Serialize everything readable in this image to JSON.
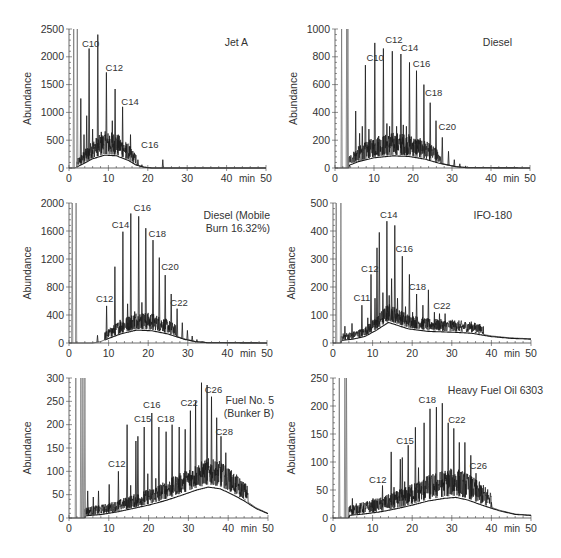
{
  "figure": {
    "panel_count": 6
  },
  "style": {
    "trace_color": "#1a1a1a",
    "trace_light_color": "#777777",
    "axis_color": "#444444",
    "text_color": "#333333",
    "background": "#ffffff"
  },
  "chart_data": [
    {
      "type": "line",
      "title": "Jet A",
      "xlabel": "min",
      "ylabel": "Abundance",
      "xlim": [
        0,
        50
      ],
      "ylim": [
        0,
        2500
      ],
      "xticks": [
        0,
        10,
        20,
        30,
        40,
        50
      ],
      "yticks": [
        0,
        500,
        1000,
        1500,
        2000,
        2500
      ],
      "grid": false,
      "layout": {
        "x0": 69,
        "x1": 266,
        "ytop": 29,
        "ybot": 168,
        "title_x": 248,
        "title_y": 46,
        "title_anchor": "end"
      },
      "hump": [
        [
          1.5,
          0
        ],
        [
          3,
          60
        ],
        [
          6,
          180
        ],
        [
          9,
          250
        ],
        [
          12,
          240
        ],
        [
          15,
          150
        ],
        [
          17,
          60
        ],
        [
          19,
          15
        ],
        [
          21,
          0
        ],
        [
          50,
          0
        ]
      ],
      "noise_range": [
        2,
        17
      ],
      "noise_amp": 330,
      "peaks": [
        [
          1.2,
          2500
        ],
        [
          2.1,
          2500
        ],
        [
          3,
          1250
        ],
        [
          3.8,
          600
        ],
        [
          4.5,
          940
        ],
        [
          5.1,
          2150
        ],
        [
          6,
          700
        ],
        [
          7.3,
          2400
        ],
        [
          8.2,
          650
        ],
        [
          9.5,
          1720
        ],
        [
          10.3,
          580
        ],
        [
          11,
          850
        ],
        [
          11.7,
          1420
        ],
        [
          12.4,
          500
        ],
        [
          13.6,
          1100
        ],
        [
          14.5,
          400
        ],
        [
          15.6,
          600
        ],
        [
          17.5,
          150
        ],
        [
          18.5,
          60
        ],
        [
          23.8,
          150
        ]
      ],
      "labels": [
        {
          "text": "C10",
          "x": 5.5,
          "y": 2180
        },
        {
          "text": "C12",
          "x": 11.5,
          "y": 1740
        },
        {
          "text": "C14",
          "x": 15.5,
          "y": 1140
        },
        {
          "text": "C16",
          "x": 20.5,
          "y": 360
        }
      ]
    },
    {
      "type": "line",
      "title": "Diesel",
      "xlabel": "min",
      "ylabel": "Abundance",
      "xlim": [
        0,
        50
      ],
      "ylim": [
        0,
        1000
      ],
      "xticks": [
        0,
        10,
        20,
        30,
        40,
        50
      ],
      "yticks": [
        0,
        200,
        400,
        600,
        800,
        1000
      ],
      "grid": false,
      "layout": {
        "x0": 335,
        "x1": 530,
        "ytop": 29,
        "ybot": 168,
        "title_x": 512,
        "title_y": 46,
        "title_anchor": "end"
      },
      "hump": [
        [
          3.5,
          20
        ],
        [
          6,
          50
        ],
        [
          10,
          80
        ],
        [
          15,
          95
        ],
        [
          19,
          90
        ],
        [
          23,
          70
        ],
        [
          27,
          35
        ],
        [
          31,
          10
        ],
        [
          34,
          2
        ],
        [
          50,
          0
        ]
      ],
      "noise_range": [
        3.5,
        27
      ],
      "noise_amp": 130,
      "peaks": [
        [
          1.7,
          1000
        ],
        [
          3,
          1000
        ],
        [
          3.3,
          1000
        ],
        [
          5.3,
          410
        ],
        [
          6.3,
          250
        ],
        [
          7,
          300
        ],
        [
          7.8,
          740
        ],
        [
          8.7,
          280
        ],
        [
          9.8,
          200
        ],
        [
          10.2,
          900
        ],
        [
          11.2,
          230
        ],
        [
          12.4,
          860
        ],
        [
          13.3,
          320
        ],
        [
          14,
          300
        ],
        [
          14.7,
          840
        ],
        [
          15.8,
          300
        ],
        [
          16.9,
          820
        ],
        [
          17.5,
          310
        ],
        [
          18.3,
          300
        ],
        [
          19.1,
          760
        ],
        [
          20.1,
          190
        ],
        [
          20.9,
          700
        ],
        [
          21.9,
          200
        ],
        [
          22.8,
          600
        ],
        [
          24.4,
          470
        ],
        [
          25.9,
          340
        ],
        [
          27.5,
          220
        ],
        [
          29.1,
          120
        ],
        [
          30.6,
          60
        ],
        [
          32,
          30
        ],
        [
          33.5,
          15
        ]
      ],
      "labels": [
        {
          "text": "C10",
          "x": 10.3,
          "y": 770
        },
        {
          "text": "C12",
          "x": 15.1,
          "y": 900
        },
        {
          "text": "C14",
          "x": 19.1,
          "y": 845
        },
        {
          "text": "C16",
          "x": 22.2,
          "y": 725
        },
        {
          "text": "C18",
          "x": 25.3,
          "y": 520
        },
        {
          "text": "C20",
          "x": 28.8,
          "y": 275
        }
      ]
    },
    {
      "type": "line",
      "title": "Diesel (Mobile Burn 16.32%)",
      "title_lines": [
        "Diesel (Mobile",
        "Burn 16.32%)"
      ],
      "xlabel": "min",
      "ylabel": "Abundance",
      "xlim": [
        0,
        50
      ],
      "ylim": [
        0,
        2000
      ],
      "xticks": [
        0,
        10,
        20,
        30,
        40,
        50
      ],
      "yticks": [
        0,
        400,
        800,
        1200,
        1600,
        2000
      ],
      "grid": false,
      "layout": {
        "x0": 69,
        "x1": 267,
        "ytop": 203,
        "ybot": 343,
        "title_x": 270,
        "title_y": 219,
        "title_anchor": "end"
      },
      "hump": [
        [
          6,
          0
        ],
        [
          8,
          20
        ],
        [
          10,
          70
        ],
        [
          13,
          140
        ],
        [
          17,
          200
        ],
        [
          21,
          190
        ],
        [
          25,
          140
        ],
        [
          29,
          60
        ],
        [
          32,
          20
        ],
        [
          35,
          5
        ],
        [
          50,
          0
        ]
      ],
      "noise_range": [
        9,
        27
      ],
      "noise_amp": 200,
      "peaks": [
        [
          0.8,
          2000
        ],
        [
          1.8,
          2000
        ],
        [
          7.2,
          110
        ],
        [
          9.5,
          530
        ],
        [
          10.8,
          210
        ],
        [
          11.6,
          1090
        ],
        [
          12.9,
          330
        ],
        [
          13.6,
          1590
        ],
        [
          14.8,
          560
        ],
        [
          15.6,
          1850
        ],
        [
          16.6,
          450
        ],
        [
          17.6,
          1810
        ],
        [
          18.4,
          580
        ],
        [
          19.4,
          1640
        ],
        [
          20.4,
          320
        ],
        [
          21.2,
          1470
        ],
        [
          22.8,
          1220
        ],
        [
          24.3,
          970
        ],
        [
          25.8,
          700
        ],
        [
          27.3,
          490
        ],
        [
          28.6,
          290
        ],
        [
          29.9,
          180
        ],
        [
          31.1,
          100
        ],
        [
          32.3,
          50
        ],
        [
          33.6,
          25
        ]
      ],
      "labels": [
        {
          "text": "C12",
          "x": 9.0,
          "y": 590
        },
        {
          "text": "C14",
          "x": 13.0,
          "y": 1650
        },
        {
          "text": "C16",
          "x": 18.5,
          "y": 1880
        },
        {
          "text": "C18",
          "x": 22.3,
          "y": 1520
        },
        {
          "text": "C20",
          "x": 25.5,
          "y": 1040
        },
        {
          "text": "C22",
          "x": 27.8,
          "y": 530
        }
      ]
    },
    {
      "type": "line",
      "title": "IFO-180",
      "xlabel": "min",
      "ylabel": "Abundance",
      "xlim": [
        0,
        50
      ],
      "ylim": [
        0,
        500
      ],
      "xticks": [
        0,
        10,
        20,
        30,
        40,
        50
      ],
      "yticks": [
        0,
        100,
        200,
        300,
        400,
        500
      ],
      "grid": false,
      "layout": {
        "x0": 333,
        "x1": 531,
        "ytop": 203,
        "ybot": 343,
        "title_x": 512,
        "title_y": 219,
        "title_anchor": "end"
      },
      "hump": [
        [
          2,
          10
        ],
        [
          5,
          15
        ],
        [
          8,
          25
        ],
        [
          11,
          50
        ],
        [
          14,
          80
        ],
        [
          16,
          70
        ],
        [
          19,
          55
        ],
        [
          24,
          45
        ],
        [
          30,
          42
        ],
        [
          35,
          38
        ],
        [
          40,
          25
        ],
        [
          45,
          18
        ],
        [
          50,
          15
        ]
      ],
      "noise_range": [
        2,
        38
      ],
      "noise_amp": 50,
      "peaks": [
        [
          0.8,
          500
        ],
        [
          2,
          500
        ],
        [
          3,
          60
        ],
        [
          4.8,
          70
        ],
        [
          7.3,
          135
        ],
        [
          8.8,
          90
        ],
        [
          9.6,
          245
        ],
        [
          10.6,
          160
        ],
        [
          11.1,
          340
        ],
        [
          11.7,
          395
        ],
        [
          12.6,
          180
        ],
        [
          13.6,
          435
        ],
        [
          14.2,
          170
        ],
        [
          14.8,
          230
        ],
        [
          15.6,
          420
        ],
        [
          16.3,
          160
        ],
        [
          17.5,
          310
        ],
        [
          18.3,
          130
        ],
        [
          19.3,
          245
        ],
        [
          20.1,
          110
        ],
        [
          21.1,
          175
        ],
        [
          22.7,
          135
        ],
        [
          24.1,
          190
        ],
        [
          25.6,
          110
        ],
        [
          26.9,
          105
        ],
        [
          28.3,
          105
        ],
        [
          29.7,
          80
        ],
        [
          31.1,
          70
        ],
        [
          32.5,
          60
        ],
        [
          34,
          50
        ],
        [
          36,
          40
        ]
      ],
      "labels": [
        {
          "text": "C11",
          "x": 7.3,
          "y": 150
        },
        {
          "text": "C12",
          "x": 9.3,
          "y": 255
        },
        {
          "text": "C14",
          "x": 14.1,
          "y": 445
        },
        {
          "text": "C16",
          "x": 18.0,
          "y": 325
        },
        {
          "text": "C18",
          "x": 21.3,
          "y": 190
        },
        {
          "text": "C22",
          "x": 27.5,
          "y": 122
        }
      ]
    },
    {
      "type": "line",
      "title": "Fuel No. 5 (Bunker B)",
      "title_lines": [
        "Fuel No. 5",
        "(Bunker B)"
      ],
      "xlabel": "min",
      "ylabel": "Abundance",
      "xlim": [
        0,
        50
      ],
      "ylim": [
        0,
        300
      ],
      "xticks": [
        0,
        10,
        20,
        30,
        40,
        50
      ],
      "yticks": [
        0,
        50,
        100,
        150,
        200,
        250,
        300
      ],
      "grid": false,
      "layout": {
        "x0": 69,
        "x1": 268,
        "ytop": 378,
        "ybot": 518,
        "title_x": 274,
        "title_y": 404,
        "title_anchor": "end"
      },
      "hump": [
        [
          4,
          5
        ],
        [
          8,
          8
        ],
        [
          12,
          14
        ],
        [
          16,
          22
        ],
        [
          20,
          30
        ],
        [
          24,
          40
        ],
        [
          28,
          52
        ],
        [
          32,
          65
        ],
        [
          35,
          72
        ],
        [
          38,
          68
        ],
        [
          41,
          55
        ],
        [
          44,
          40
        ],
        [
          47,
          22
        ],
        [
          50,
          10
        ]
      ],
      "noise_range": [
        4,
        45
      ],
      "noise_amp": 45,
      "peaks": [
        [
          1.7,
          300
        ],
        [
          3,
          300
        ],
        [
          3.5,
          300
        ],
        [
          4,
          300
        ],
        [
          4.7,
          58
        ],
        [
          6.1,
          45
        ],
        [
          7.4,
          58
        ],
        [
          10.1,
          72
        ],
        [
          12.4,
          100
        ],
        [
          14.6,
          200
        ],
        [
          15.5,
          70
        ],
        [
          16.8,
          165
        ],
        [
          17.3,
          175
        ],
        [
          18.9,
          195
        ],
        [
          19.8,
          95
        ],
        [
          20.8,
          225
        ],
        [
          21.8,
          85
        ],
        [
          22.6,
          195
        ],
        [
          24.4,
          185
        ],
        [
          25.9,
          200
        ],
        [
          27.7,
          195
        ],
        [
          29.2,
          190
        ],
        [
          30.5,
          230
        ],
        [
          31.8,
          250
        ],
        [
          33.3,
          290
        ],
        [
          34.7,
          285
        ],
        [
          35.8,
          260
        ],
        [
          37.1,
          215
        ],
        [
          38.2,
          175
        ],
        [
          39.4,
          140
        ],
        [
          40.6,
          100
        ],
        [
          41.8,
          75
        ],
        [
          43,
          55
        ],
        [
          44.2,
          40
        ]
      ],
      "labels": [
        {
          "text": "C12",
          "x": 12.0,
          "y": 110
        },
        {
          "text": "C15",
          "x": 18.5,
          "y": 205
        },
        {
          "text": "C16",
          "x": 20.8,
          "y": 235
        },
        {
          "text": "C18",
          "x": 24.3,
          "y": 205
        },
        {
          "text": "C22",
          "x": 30.2,
          "y": 240
        },
        {
          "text": "C26",
          "x": 36.3,
          "y": 268
        },
        {
          "text": "C28",
          "x": 39.0,
          "y": 178
        }
      ]
    },
    {
      "type": "line",
      "title": "Heavy Fuel Oil 6303",
      "xlabel": "min",
      "ylabel": "Abundance",
      "xlim": [
        0,
        50
      ],
      "ylim": [
        0,
        250
      ],
      "xticks": [
        0,
        10,
        20,
        30,
        40,
        50
      ],
      "yticks": [
        0,
        50,
        100,
        150,
        200,
        250
      ],
      "grid": false,
      "layout": {
        "x0": 333,
        "x1": 531,
        "ytop": 378,
        "ybot": 518,
        "title_x": 543,
        "title_y": 394,
        "title_anchor": "end"
      },
      "hump": [
        [
          4,
          5
        ],
        [
          8,
          8
        ],
        [
          12,
          12
        ],
        [
          16,
          18
        ],
        [
          20,
          25
        ],
        [
          24,
          33
        ],
        [
          28,
          38
        ],
        [
          31,
          40
        ],
        [
          34,
          35
        ],
        [
          38,
          24
        ],
        [
          42,
          14
        ],
        [
          46,
          7
        ],
        [
          50,
          5
        ]
      ],
      "noise_range": [
        4,
        40
      ],
      "noise_amp": 40,
      "peaks": [
        [
          1.6,
          250
        ],
        [
          3,
          250
        ],
        [
          3.4,
          250
        ],
        [
          4.9,
          35
        ],
        [
          7.7,
          22
        ],
        [
          10.1,
          35
        ],
        [
          12.5,
          58
        ],
        [
          14.7,
          118
        ],
        [
          15.4,
          55
        ],
        [
          17,
          105
        ],
        [
          17.5,
          108
        ],
        [
          18.1,
          65
        ],
        [
          19,
          130
        ],
        [
          19.9,
          60
        ],
        [
          20.8,
          162
        ],
        [
          21.6,
          90
        ],
        [
          23,
          170
        ],
        [
          24.5,
          195
        ],
        [
          26.1,
          198
        ],
        [
          27.6,
          205
        ],
        [
          29.1,
          170
        ],
        [
          30.5,
          160
        ],
        [
          31.9,
          135
        ],
        [
          33.3,
          135
        ],
        [
          34.8,
          112
        ],
        [
          36.1,
          80
        ],
        [
          37.4,
          58
        ],
        [
          38.6,
          40
        ],
        [
          40,
          28
        ]
      ],
      "labels": [
        {
          "text": "C12",
          "x": 11.3,
          "y": 63
        },
        {
          "text": "C15",
          "x": 18.2,
          "y": 133
        },
        {
          "text": "C18",
          "x": 23.8,
          "y": 205
        },
        {
          "text": "C22",
          "x": 31.3,
          "y": 170
        },
        {
          "text": "C26",
          "x": 36.7,
          "y": 88
        }
      ]
    }
  ]
}
